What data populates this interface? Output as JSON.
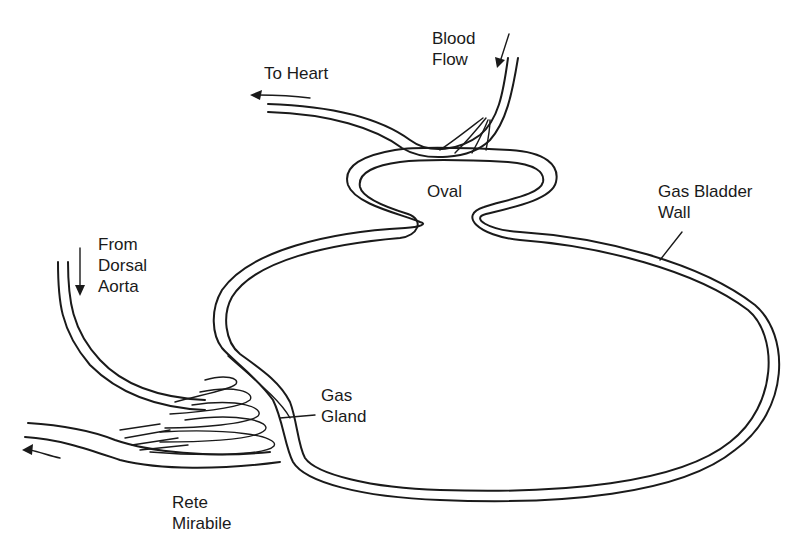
{
  "diagram": {
    "labels": {
      "blood_flow": {
        "line1": "Blood",
        "line2": "Flow"
      },
      "to_heart": "To Heart",
      "oval": "Oval",
      "gas_bladder_wall": {
        "line1": "Gas Bladder",
        "line2": "Wall"
      },
      "from_dorsal_aorta": {
        "line1": "From",
        "line2": "Dorsal",
        "line3": "Aorta"
      },
      "gas_gland": {
        "line1": "Gas",
        "line2": "Gland"
      },
      "rete_mirabile": {
        "line1": "Rete",
        "line2": "Mirabile"
      }
    },
    "arrows": [
      {
        "name": "blood-flow-arrow",
        "direction": "down-left"
      },
      {
        "name": "to-heart-arrow",
        "direction": "left"
      },
      {
        "name": "dorsal-aorta-arrow",
        "direction": "down"
      },
      {
        "name": "outflow-arrow",
        "direction": "left"
      }
    ],
    "colors": {
      "line": "#1a1a1a",
      "background": "#ffffff"
    }
  }
}
